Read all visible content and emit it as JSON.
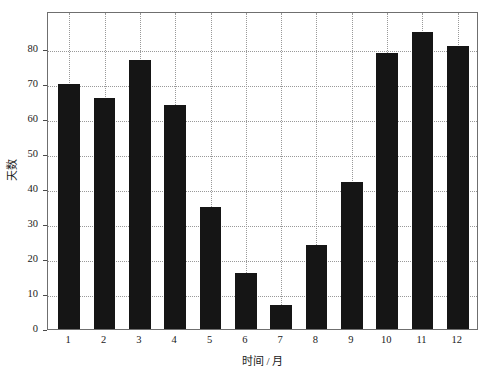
{
  "chart_data": {
    "type": "bar",
    "title": "",
    "subtitle": "",
    "xlabel": "时间 / 月",
    "ylabel": "天数",
    "categories": [
      "1",
      "2",
      "3",
      "4",
      "5",
      "6",
      "7",
      "8",
      "9",
      "10",
      "11",
      "12"
    ],
    "values": [
      70,
      66,
      77,
      64,
      35,
      16,
      7,
      24,
      42,
      79,
      85,
      81
    ],
    "series": [
      {
        "name": "天数",
        "values": [
          70,
          66,
          77,
          64,
          35,
          16,
          7,
          24,
          42,
          79,
          85,
          81
        ]
      }
    ],
    "ylim": [
      0,
      91
    ],
    "xlim": [
      0.4,
      12.6
    ],
    "yticks": [
      0,
      10,
      20,
      30,
      40,
      50,
      60,
      70,
      80
    ],
    "ytick_labels": [
      "0",
      "10",
      "20",
      "30",
      "40",
      "50",
      "60",
      "70",
      "80"
    ],
    "xticks": [
      1,
      2,
      3,
      4,
      5,
      6,
      7,
      8,
      9,
      10,
      11,
      12
    ],
    "xtick_labels": [
      "1",
      "2",
      "3",
      "4",
      "5",
      "6",
      "7",
      "8",
      "9",
      "10",
      "11",
      "12"
    ],
    "grid": true,
    "grid_style": "dotted",
    "grid_axis": "both",
    "legend": null,
    "legend_position": "none",
    "bar_color": "#151515",
    "grid_color": "#999999",
    "axis_color": "#6f6f6f",
    "background_color": "#ffffff",
    "bar_width_fraction": 0.62,
    "annotations": []
  },
  "figure": {
    "background_color": "#ffffff",
    "text_color": "#1a1a1a"
  }
}
